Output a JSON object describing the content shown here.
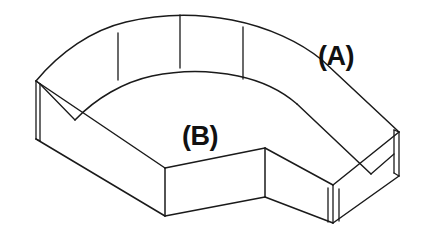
{
  "drawing": {
    "title": "Isometric L-shaped block with curved back wall",
    "background_color": "#ffffff",
    "line_color": "#1a1a1a",
    "width": 431,
    "height": 244
  },
  "labels": [
    {
      "id": "label-a",
      "text": "(A)",
      "x": 318,
      "y": 65,
      "description": "callout on upper right top face"
    },
    {
      "id": "label-b",
      "text": "(B)",
      "x": 182,
      "y": 145,
      "description": "callout on lower center top face"
    }
  ],
  "geometry": {
    "top_outer_curve": "M 36,81 C 60,52 92,30 126,22 C 160,14 196,13 232,20 C 268,27 300,42 322,60",
    "top_outer_right": "L 399,132",
    "top_inner_curve": "M 75,120 C 96,98 124,82 152,76 C 180,70 210,70 238,76 C 262,81 282,91 297,104",
    "bottom_front_left": "M 36,138 L 165,215",
    "label_a_anchor": "top-right-face",
    "label_b_anchor": "center-top-face"
  },
  "features": {
    "tangent_lines": [
      {
        "id": "tangent-1",
        "x1": 118,
        "y1": 33,
        "x2": 118,
        "y2": 80
      },
      {
        "id": "tangent-2",
        "x1": 180,
        "y1": 15,
        "x2": 180,
        "y2": 68
      },
      {
        "id": "tangent-3",
        "x1": 243,
        "y1": 27,
        "x2": 243,
        "y2": 79
      }
    ],
    "left_end_face": {
      "id": "left-sliver",
      "x": 34,
      "y_top": 80,
      "y_bottom": 139,
      "width": 4
    },
    "right_end_face": {
      "id": "right-sliver",
      "x": 396,
      "y_top": 131,
      "y_bottom": 176,
      "width": 5
    },
    "corner_rib": {
      "id": "bottom-right-rib",
      "x": 328,
      "y_top": 184,
      "y_bottom": 223,
      "width": 12
    },
    "front_left_corner": {
      "id": "front-corner",
      "x": 165,
      "y_top": 168,
      "y_bottom": 216
    },
    "inner_step_corner": {
      "id": "inner-corner",
      "x": 265,
      "y_top": 148,
      "y_bottom": 197
    }
  }
}
